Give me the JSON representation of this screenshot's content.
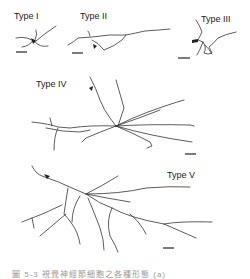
{
  "figure": {
    "panels": [
      {
        "id": "type-1",
        "label": "Type I"
      },
      {
        "id": "type-2",
        "label": "Type II"
      },
      {
        "id": "type-3",
        "label": "Type III"
      },
      {
        "id": "type-4",
        "label": "Type IV"
      },
      {
        "id": "type-5",
        "label": "Type V"
      }
    ],
    "caption": "圖 5-3  視覺神經節細胞之各種形態 (a)"
  }
}
